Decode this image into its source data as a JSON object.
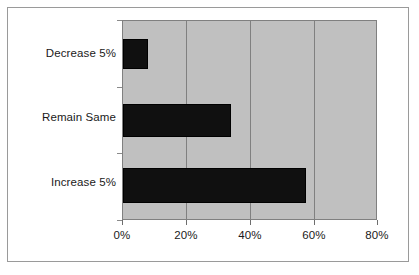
{
  "chart_data": {
    "type": "bar",
    "orientation": "horizontal",
    "title": "",
    "subtitle": "",
    "xlabel": "",
    "ylabel": "",
    "categories": [
      "Decrease 5%",
      "Remain Same",
      "Increase 5%"
    ],
    "values": [
      8,
      34,
      58
    ],
    "value_unit": "%",
    "xlim": [
      0,
      80
    ],
    "xticks": [
      0,
      20,
      40,
      60,
      80
    ],
    "xtick_labels": [
      "0%",
      "20%",
      "40%",
      "60%",
      "80%"
    ],
    "category_order_top_to_bottom": [
      "Decrease 5%",
      "Remain Same",
      "Increase 5%"
    ],
    "grid": {
      "vertical": true,
      "horizontal": false
    },
    "legend": {
      "visible": false,
      "position": "none",
      "entries": []
    },
    "annotations": [],
    "colors": {
      "bar": "#101010",
      "bar_border": "#000000",
      "plot_background": "#c0c0c0",
      "gridline": "#808080",
      "figure_background": "#ffffff",
      "frame_border": "#9a9a9a",
      "axis_text": "#1a1a1a",
      "tick_mark": "#6e6e6e"
    }
  },
  "axis": {
    "x_tick_labels": [
      "0%",
      "20%",
      "40%",
      "60%",
      "80%"
    ],
    "y_tick_labels": [
      "Decrease 5%",
      "Remain Same",
      "Increase 5%"
    ]
  }
}
